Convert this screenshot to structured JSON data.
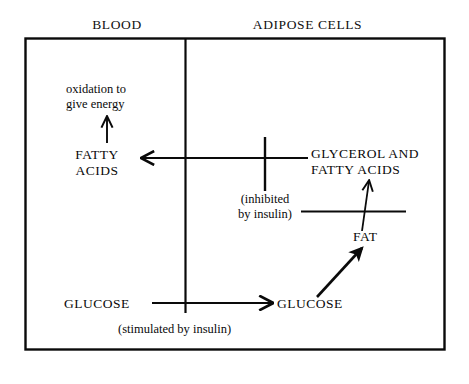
{
  "figure": {
    "type": "biological-pathway-diagram",
    "background_color": "#ffffff",
    "line_color": "#0a0a0a",
    "text_color": "#0a0a0a"
  },
  "compartments": [
    {
      "id": "blood",
      "label": "BLOOD"
    },
    {
      "id": "adipose",
      "label": "ADIPOSE CELLS"
    }
  ],
  "nodes": {
    "oxidation": {
      "line1": "oxidation to",
      "line2": "give energy"
    },
    "fatty_acids_blood": {
      "line1": "FATTY",
      "line2": "ACIDS"
    },
    "glycerol_and_fatty_acids": {
      "line1": "GLYCEROL AND",
      "line2": "FATTY ACIDS"
    },
    "fat": {
      "label": "FAT"
    },
    "glucose_blood": {
      "label": "GLUCOSE"
    },
    "glucose_adipose": {
      "label": "GLUCOSE"
    }
  },
  "annotations": {
    "inhibited_by_insulin": {
      "line1": "(inhibited",
      "line2": "by insulin)"
    },
    "stimulated_by_insulin": {
      "label": "(stimulated by insulin)"
    }
  },
  "arrows": [
    {
      "id": "fatty-acids-to-oxidation",
      "from": "FATTY ACIDS",
      "to": "oxidation to give energy",
      "direction": "up"
    },
    {
      "id": "glycerol-to-fatty-acids",
      "from": "GLYCEROL AND FATTY ACIDS",
      "to": "FATTY ACIDS",
      "direction": "left",
      "inhibited": true
    },
    {
      "id": "fat-to-glycerol",
      "from": "FAT",
      "to": "GLYCEROL AND FATTY ACIDS",
      "direction": "up",
      "inhibited": true
    },
    {
      "id": "glucose-to-glucose",
      "from": "GLUCOSE (blood)",
      "to": "GLUCOSE (adipose)",
      "direction": "right",
      "stimulated": true
    },
    {
      "id": "glucose-to-fat",
      "from": "GLUCOSE (adipose)",
      "to": "FAT",
      "direction": "up-right"
    }
  ]
}
